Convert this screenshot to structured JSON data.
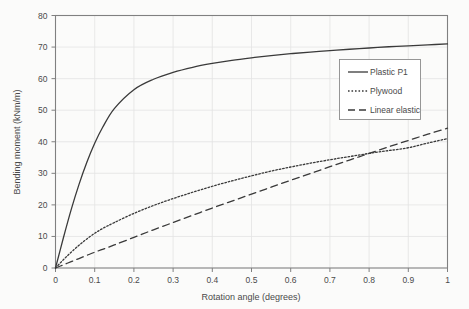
{
  "chart_data": {
    "type": "line",
    "title": "",
    "xlabel": "Rotation angle (degrees)",
    "ylabel": "Bending moment (kNm/m)",
    "xlim": [
      0,
      1
    ],
    "ylim": [
      0,
      80
    ],
    "xticks": [
      "0",
      "0.1",
      "0.2",
      "0.3",
      "0.4",
      "0.5",
      "0.6",
      "0.7",
      "0.8",
      "0.9",
      "1"
    ],
    "xtick_values": [
      0,
      0.1,
      0.2,
      0.3,
      0.4,
      0.5,
      0.6,
      0.7,
      0.8,
      0.9,
      1
    ],
    "yticks": [
      "0",
      "10",
      "20",
      "30",
      "40",
      "50",
      "60",
      "70",
      "80"
    ],
    "ytick_values": [
      0,
      10,
      20,
      30,
      40,
      50,
      60,
      70,
      80
    ],
    "grid": true,
    "legend_position": "upper right",
    "line_color": "#3a3a3a",
    "grid_color": "#e3e3e3",
    "frame_color": "#808080",
    "background_color": "#fbfbfa",
    "x": [
      0,
      0.02,
      0.04,
      0.06,
      0.08,
      0.1,
      0.12,
      0.15,
      0.2,
      0.25,
      0.3,
      0.35,
      0.4,
      0.45,
      0.5,
      0.55,
      0.6,
      0.65,
      0.7,
      0.75,
      0.8,
      0.85,
      0.9,
      0.95,
      1
    ],
    "series": [
      {
        "name": "Plastic P1",
        "style": "solid",
        "values": [
          0,
          9.5,
          18.5,
          26.5,
          33.5,
          39.5,
          44.5,
          50.5,
          56.5,
          59.8,
          62.0,
          63.6,
          64.8,
          65.8,
          66.6,
          67.3,
          67.9,
          68.4,
          68.9,
          69.3,
          69.7,
          70.1,
          70.4,
          70.7,
          71.0
        ]
      },
      {
        "name": "Plywood",
        "style": "dotted",
        "values": [
          0,
          2.6,
          5.0,
          7.2,
          9.2,
          11.0,
          12.5,
          14.4,
          17.3,
          19.8,
          22.0,
          24.0,
          25.9,
          27.6,
          29.2,
          30.7,
          32.0,
          33.2,
          34.3,
          35.3,
          36.3,
          37.2,
          38.1,
          39.6,
          41.0
        ]
      },
      {
        "name": "Linear elastic",
        "style": "dashed",
        "values": [
          0,
          1.0,
          2.0,
          3.0,
          4.0,
          5.0,
          5.9,
          7.3,
          9.7,
          12.1,
          14.4,
          16.7,
          19.0,
          21.2,
          23.4,
          25.6,
          27.8,
          29.9,
          32.1,
          34.2,
          36.3,
          38.4,
          40.4,
          42.4,
          44.3
        ]
      }
    ],
    "annotations": []
  }
}
